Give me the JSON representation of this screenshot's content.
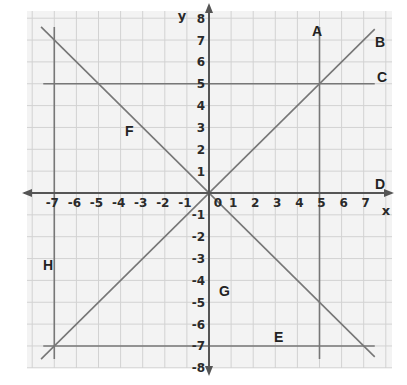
{
  "diagram": {
    "type": "coordinate-plane",
    "axes": {
      "x_label": "x",
      "y_label": "y",
      "x_range": [
        -7,
        7
      ],
      "y_range": [
        -8,
        8
      ],
      "x_ticks": [
        "-7",
        "-6",
        "-5",
        "-4",
        "-3",
        "-2",
        "-1",
        "0",
        "1",
        "2",
        "3",
        "4",
        "5",
        "6",
        "7"
      ],
      "y_ticks": [
        "8",
        "7",
        "6",
        "5",
        "4",
        "3",
        "2",
        "1",
        "-1",
        "-2",
        "-3",
        "-4",
        "-5",
        "-6",
        "-7",
        "-8"
      ]
    },
    "lines": [
      {
        "label": "A",
        "equation": "x = 5"
      },
      {
        "label": "B",
        "equation": "y = x"
      },
      {
        "label": "C",
        "equation": "y = 5"
      },
      {
        "label": "D",
        "equation": "y = 0 (x-axis)"
      },
      {
        "label": "E",
        "equation": "y = -7"
      },
      {
        "label": "F",
        "equation": "y = -x"
      },
      {
        "label": "G",
        "equation": "x = 0 (y-axis)"
      },
      {
        "label": "H",
        "equation": "x = -7"
      }
    ],
    "colors": {
      "grid": "#d4d4d4",
      "panel": "#f3f3f3",
      "line": "#777777",
      "axis": "#555555",
      "text": "#222222"
    }
  }
}
